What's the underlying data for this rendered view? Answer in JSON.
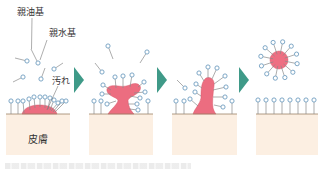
{
  "diagram": {
    "labels": {
      "lipophilic_group": "親油基",
      "hydrophilic_group": "親水基",
      "dirt": "汚れ",
      "skin": "皮膚"
    },
    "colors": {
      "skin_fill": "#fcefe2",
      "skin_surface": "#9c8468",
      "dirt_fill": "#ec6d80",
      "dirt_stroke": "#d95a6d",
      "arrow": "#3f9a88",
      "molecule_stem": "#8a8a8a",
      "molecule_head": "#6f9dc0",
      "text": "#333333"
    },
    "stages": [
      {
        "name": "stage-1-surfactant-approaches",
        "molecules": [
          [
            31,
            49,
            38,
            63
          ],
          [
            15,
            58,
            27,
            61
          ],
          [
            63,
            63,
            54,
            69
          ],
          [
            13,
            82,
            23,
            77
          ],
          [
            45,
            68,
            41,
            79
          ],
          [
            11,
            114,
            11,
            101
          ],
          [
            18,
            114,
            18,
            101
          ],
          [
            24,
            113,
            23,
            101
          ],
          [
            30,
            110,
            29,
            99
          ],
          [
            35,
            108,
            34,
            97
          ],
          [
            40,
            107,
            40,
            97
          ],
          [
            45,
            108,
            45,
            97
          ],
          [
            48,
            109,
            50,
            98
          ],
          [
            50,
            110,
            54,
            100
          ],
          [
            51,
            111,
            58,
            103
          ],
          [
            53,
            112,
            62,
            101
          ],
          [
            55,
            112,
            66,
            101
          ]
        ]
      },
      {
        "name": "stage-2-dirt-lifting",
        "molecules": [
          [
            113,
            59,
            108,
            46
          ],
          [
            140,
            63,
            147,
            52
          ],
          [
            95,
            63,
            102,
            72
          ],
          [
            94,
            114,
            94,
            101
          ],
          [
            101,
            114,
            101,
            101
          ],
          [
            148,
            114,
            148,
            101
          ],
          [
            116,
            88,
            115,
            77
          ],
          [
            123,
            88,
            123,
            76
          ],
          [
            130,
            87,
            132,
            75
          ],
          [
            111,
            90,
            103,
            85
          ],
          [
            111,
            94,
            102,
            94
          ],
          [
            116,
            101,
            107,
            104
          ],
          [
            138,
            87,
            144,
            82
          ],
          [
            134,
            93,
            145,
            92
          ],
          [
            130,
            96,
            140,
            98
          ],
          [
            128,
            104,
            137,
            104
          ],
          [
            129,
            109,
            138,
            110
          ]
        ]
      },
      {
        "name": "stage-3-dirt-detaching",
        "molecules": [
          [
            177,
            80,
            185,
            88
          ],
          [
            176,
            114,
            176,
            101
          ],
          [
            184,
            114,
            184,
            101
          ],
          [
            232,
            114,
            232,
            101
          ],
          [
            198,
            106,
            190,
            99
          ],
          [
            201,
            96,
            195,
            92
          ],
          [
            202,
            88,
            196,
            84
          ],
          [
            204,
            81,
            199,
            73
          ],
          [
            208,
            78,
            208,
            67
          ],
          [
            212,
            79,
            217,
            68
          ],
          [
            214,
            84,
            225,
            76
          ],
          [
            213,
            90,
            226,
            87
          ],
          [
            213,
            97,
            225,
            97
          ],
          [
            214,
            105,
            223,
            107
          ]
        ]
      },
      {
        "name": "stage-4-micelle-removed",
        "molecules": [
          [
            258,
            114,
            258,
            100
          ],
          [
            266,
            114,
            266,
            100
          ],
          [
            274,
            114,
            274,
            100
          ],
          [
            282,
            114,
            282,
            100
          ],
          [
            290,
            114,
            290,
            100
          ],
          [
            298,
            114,
            298,
            100
          ],
          [
            306,
            114,
            306,
            100
          ],
          [
            314,
            114,
            314,
            100
          ]
        ],
        "micelle": {
          "cx": 279,
          "cy": 60,
          "r": 9,
          "arm_len": 18.5,
          "arms": 12
        }
      }
    ]
  }
}
